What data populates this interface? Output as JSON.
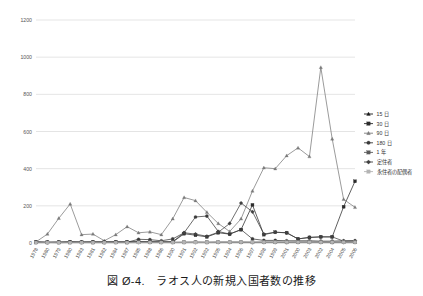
{
  "caption": "図 Ø-4.　ラオス人の新規入国者数の推移",
  "chart_data": {
    "type": "line",
    "title": "",
    "xlabel": "",
    "ylabel": "",
    "ylim": [
      0,
      1200
    ],
    "yticks": [
      0,
      200,
      400,
      600,
      800,
      1000,
      1200
    ],
    "grid": true,
    "legend_position": "right",
    "categories": [
      "1978",
      "1980",
      "1979",
      "1980",
      "1983",
      "1981",
      "1982",
      "1984",
      "1987",
      "1985",
      "1988",
      "1986",
      "1990",
      "1991",
      "1992",
      "1992",
      "1995",
      "1994",
      "1996",
      "1997",
      "1998",
      "1999",
      "2001",
      "2000",
      "2003",
      "2002",
      "2004",
      "2005",
      "2006"
    ],
    "series": [
      {
        "name": "15 日",
        "color": "#1a1a1a",
        "marker": "triangle",
        "values": [
          4,
          3,
          2,
          3,
          4,
          3,
          3,
          4,
          3,
          4,
          4,
          3,
          3,
          3,
          4,
          3,
          4,
          4,
          4,
          3,
          4,
          4,
          3,
          4,
          4,
          4,
          3,
          4,
          4
        ]
      },
      {
        "name": "30 日",
        "color": "#2b2b2b",
        "marker": "square",
        "values": [
          5,
          4,
          4,
          5,
          4,
          5,
          5,
          4,
          5,
          6,
          5,
          6,
          5,
          50,
          42,
          33,
          55,
          48,
          72,
          205,
          45,
          58,
          55,
          22,
          30,
          33,
          33,
          195,
          332
        ]
      },
      {
        "name": "90 日",
        "color": "#7a7a7a",
        "marker": "triangle",
        "values": [
          6,
          48,
          133,
          210,
          45,
          48,
          12,
          45,
          88,
          55,
          60,
          45,
          130,
          245,
          228,
          165,
          105,
          62,
          130,
          280,
          405,
          400,
          470,
          512,
          465,
          945,
          560,
          235,
          192
        ]
      },
      {
        "name": "180 日",
        "color": "#3a3a3a",
        "marker": "circle",
        "values": [
          4,
          3,
          4,
          5,
          4,
          4,
          4,
          5,
          4,
          20,
          18,
          12,
          22,
          55,
          140,
          145,
          62,
          48,
          72,
          22,
          14,
          14,
          12,
          12,
          12,
          10,
          10,
          12,
          12
        ]
      },
      {
        "name": "1 年",
        "color": "#5a5a5a",
        "marker": "square",
        "values": [
          3,
          3,
          3,
          3,
          3,
          3,
          3,
          4,
          3,
          4,
          4,
          4,
          4,
          5,
          5,
          5,
          5,
          5,
          5,
          5,
          5,
          5,
          5,
          5,
          5,
          5,
          5,
          5,
          5
        ]
      },
      {
        "name": "定住者",
        "color": "#404040",
        "marker": "diamond",
        "values": [
          5,
          4,
          5,
          6,
          5,
          6,
          6,
          5,
          6,
          7,
          7,
          6,
          7,
          55,
          48,
          36,
          58,
          105,
          215,
          168,
          48,
          58,
          55,
          22,
          30,
          33,
          33,
          10,
          12
        ]
      },
      {
        "name": "永住者の配偶者",
        "color": "#b4b4b4",
        "marker": "square",
        "values": [
          2,
          2,
          2,
          2,
          2,
          2,
          2,
          2,
          2,
          3,
          3,
          3,
          3,
          3,
          3,
          3,
          4,
          4,
          4,
          4,
          4,
          4,
          4,
          4,
          4,
          4,
          4,
          4,
          4
        ]
      }
    ]
  }
}
